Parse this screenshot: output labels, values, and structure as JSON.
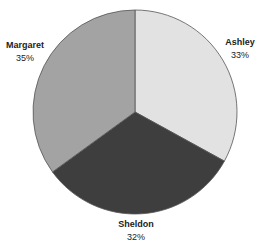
{
  "chart_data": {
    "type": "pie",
    "title": "",
    "categories": [
      "Ashley",
      "Sheldon",
      "Margaret"
    ],
    "values": [
      33,
      32,
      35
    ],
    "labels": [
      "33%",
      "32%",
      "35%"
    ],
    "colors": [
      "#e2e2e2",
      "#3e3e3e",
      "#a3a3a3"
    ],
    "start_angle_deg": 0,
    "direction": "clockwise",
    "legend": "none",
    "data_labels": "outside, category name + percent"
  },
  "slices": [
    {
      "name": "Ashley",
      "pct": "33%"
    },
    {
      "name": "Sheldon",
      "pct": "32%"
    },
    {
      "name": "Margaret",
      "pct": "35%"
    }
  ]
}
